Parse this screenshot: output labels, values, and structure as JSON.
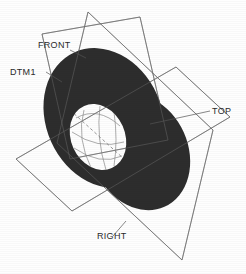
{
  "viewport": {
    "background_color": "#fefefe",
    "line_color": "#555555",
    "solid_fill_color": "#2d2d2d",
    "label_color": "#2b2b2b",
    "width": 246,
    "height": 274
  },
  "labels": {
    "front": "FRONT",
    "dtm1": "DTM1",
    "top": "TOP",
    "right": "RIGHT"
  },
  "datum_planes": [
    {
      "name": "FRONT",
      "label": "FRONT",
      "label_x": 38,
      "label_y": 48,
      "corners": "42,34 140,17 168,140 70,159",
      "leader": "70,50 86,58"
    },
    {
      "name": "TOP",
      "label": "TOP",
      "label_x": 212,
      "label_y": 114,
      "corners": "16,159 176,67 230,117 72,211",
      "leader": "210,111 150,124"
    },
    {
      "name": "RIGHT",
      "label": "RIGHT",
      "label_x": 97,
      "label_y": 239,
      "corners": "88,12 213,130 182,260 57,143",
      "leader": "113,236 126,221"
    }
  ],
  "datum_axis": {
    "name": "DTM1",
    "label": "DTM1",
    "label_x": 10,
    "label_y": 75,
    "leader": "46,72 62,82"
  },
  "solid": {
    "type": "torus-ring",
    "lobes": [
      {
        "cx": 104,
        "cy": 118,
        "rx": 58,
        "ry": 72,
        "rotation": -24
      },
      {
        "cx": 140,
        "cy": 152,
        "rx": 48,
        "ry": 60,
        "rotation": -24
      }
    ],
    "hole": {
      "cx": 98,
      "cy": 137,
      "rx": 27,
      "ry": 34,
      "rotation": -24
    }
  },
  "hole_wireframe": {
    "arcs": [
      "M 76,118 Q 98,106 120,126",
      "M 72,132 Q 98,150 124,142",
      "M 74,148 Q 100,166 122,156",
      "M 84,110 Q 76,138 92,170",
      "M 100,106 Q 96,138 106,170",
      "M 114,112 Q 118,140 114,166"
    ],
    "dashed_axis": "M 70,110 L 134,168"
  }
}
